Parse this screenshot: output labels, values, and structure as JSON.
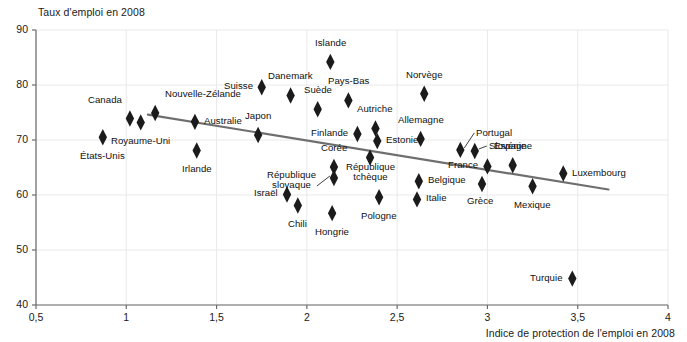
{
  "chart_data": {
    "type": "scatter",
    "title": "",
    "ylabel": "Taux d'emploi en 2008",
    "xlabel": "Indice de protection de l'emploi en 2008",
    "xlim": [
      0.5,
      4.0
    ],
    "ylim": [
      40,
      90
    ],
    "xticks": [
      "0,5",
      "1",
      "1,5",
      "2",
      "2,5",
      "3",
      "3,5",
      "4"
    ],
    "xtick_values": [
      0.5,
      1,
      1.5,
      2,
      2.5,
      3,
      3.5,
      4
    ],
    "yticks": [
      "90",
      "80",
      "70",
      "60",
      "50",
      "40"
    ],
    "ytick_values": [
      90,
      80,
      70,
      60,
      50,
      40
    ],
    "grid": true,
    "legend": false,
    "marker": "diamond",
    "marker_color": "#1b1b1b",
    "trendline": {
      "x0": 1.12,
      "y0": 74.6,
      "x1": 3.67,
      "y1": 61.0,
      "color": "#6e6e6e"
    },
    "points": [
      {
        "label": "États-Unis",
        "x": 0.87,
        "y": 70.5,
        "label_pos": "below"
      },
      {
        "label": "Royaume-Uni",
        "x": 1.08,
        "y": 73.2,
        "label_pos": "below"
      },
      {
        "label": "Canada",
        "x": 1.02,
        "y": 73.9,
        "label_pos": "above-left"
      },
      {
        "label": "Nouvelle-Zélande",
        "x": 1.16,
        "y": 74.9,
        "label_pos": "above-right"
      },
      {
        "label": "Australie",
        "x": 1.38,
        "y": 73.3,
        "label_pos": "right"
      },
      {
        "label": "Irlande",
        "x": 1.39,
        "y": 68.1,
        "label_pos": "below"
      },
      {
        "label": "Japon",
        "x": 1.73,
        "y": 70.9,
        "label_pos": "above"
      },
      {
        "label": "Suisse",
        "x": 1.75,
        "y": 79.6,
        "label_pos": "left"
      },
      {
        "label": "Danemark",
        "x": 1.91,
        "y": 78.1,
        "label_pos": "above"
      },
      {
        "label": "Suède",
        "x": 2.06,
        "y": 75.6,
        "label_pos": "above"
      },
      {
        "label": "Pays-Bas",
        "x": 2.23,
        "y": 77.2,
        "label_pos": "above"
      },
      {
        "label": "Islande",
        "x": 2.13,
        "y": 84.2,
        "label_pos": "above"
      },
      {
        "label": "Norvège",
        "x": 2.65,
        "y": 78.4,
        "label_pos": "above"
      },
      {
        "label": "Autriche",
        "x": 2.38,
        "y": 72.1,
        "label_pos": "above"
      },
      {
        "label": "Finlande",
        "x": 2.28,
        "y": 71.1,
        "label_pos": "left"
      },
      {
        "label": "Estonie",
        "x": 2.39,
        "y": 69.8,
        "label_pos": "right"
      },
      {
        "label": "Allemagne",
        "x": 2.63,
        "y": 70.2,
        "label_pos": "above"
      },
      {
        "label": "Portugal",
        "x": 2.85,
        "y": 68.2,
        "label_pos": "leader-upper-right"
      },
      {
        "label": "Slovénie",
        "x": 2.93,
        "y": 68.0,
        "label_pos": "leader-right"
      },
      {
        "label": "France",
        "x": 3.0,
        "y": 65.2,
        "label_pos": "left"
      },
      {
        "label": "Espagne",
        "x": 3.14,
        "y": 65.4,
        "label_pos": "above"
      },
      {
        "label": "Luxembourg",
        "x": 3.42,
        "y": 63.9,
        "label_pos": "right"
      },
      {
        "label": "Mexique",
        "x": 3.25,
        "y": 61.6,
        "label_pos": "below"
      },
      {
        "label": "Grèce",
        "x": 2.97,
        "y": 62.0,
        "label_pos": "below-left"
      },
      {
        "label": "Belgique",
        "x": 2.62,
        "y": 62.5,
        "label_pos": "right"
      },
      {
        "label": "Italie",
        "x": 2.61,
        "y": 59.2,
        "label_pos": "right"
      },
      {
        "label": "Pologne",
        "x": 2.4,
        "y": 59.6,
        "label_pos": "below"
      },
      {
        "label": "République tchèque",
        "x": 2.35,
        "y": 66.8,
        "label_pos": "below"
      },
      {
        "label": "Corée",
        "x": 2.15,
        "y": 65.1,
        "label_pos": "above"
      },
      {
        "label": "République slovaque",
        "x": 2.15,
        "y": 63.1,
        "label_pos": "leader-left"
      },
      {
        "label": "Hongrie",
        "x": 2.14,
        "y": 56.7,
        "label_pos": "below"
      },
      {
        "label": "Chili",
        "x": 1.95,
        "y": 58.1,
        "label_pos": "below"
      },
      {
        "label": "Israël",
        "x": 1.89,
        "y": 60.1,
        "label_pos": "left"
      },
      {
        "label": "Turquie",
        "x": 3.47,
        "y": 44.8,
        "label_pos": "left"
      }
    ]
  },
  "labels": {
    "etats_unis": "États-Unis",
    "royaume_uni": "Royaume-Uni",
    "canada": "Canada",
    "nouvelle_zelande": "Nouvelle-Zélande",
    "australie": "Australie",
    "irlande": "Irlande",
    "japon": "Japon",
    "suisse": "Suisse",
    "danemark": "Danemark",
    "suede": "Suède",
    "pays_bas": "Pays-Bas",
    "islande": "Islande",
    "norvege": "Norvège",
    "autriche": "Autriche",
    "finlande": "Finlande",
    "estonie": "Estonie",
    "allemagne": "Allemagne",
    "portugal": "Portugal",
    "slovenie": "Slovénie",
    "france": "France",
    "espagne": "Espagne",
    "luxembourg": "Luxembourg",
    "mexique": "Mexique",
    "grece": "Grèce",
    "belgique": "Belgique",
    "italie": "Italie",
    "pologne": "Pologne",
    "rep_tcheque_l1": "République",
    "rep_tcheque_l2": "tchèque",
    "coree": "Corée",
    "rep_slovaque_l1": "République",
    "rep_slovaque_l2": "slovaque",
    "hongrie": "Hongrie",
    "chili": "Chili",
    "israel": "Israël",
    "turquie": "Turquie"
  }
}
